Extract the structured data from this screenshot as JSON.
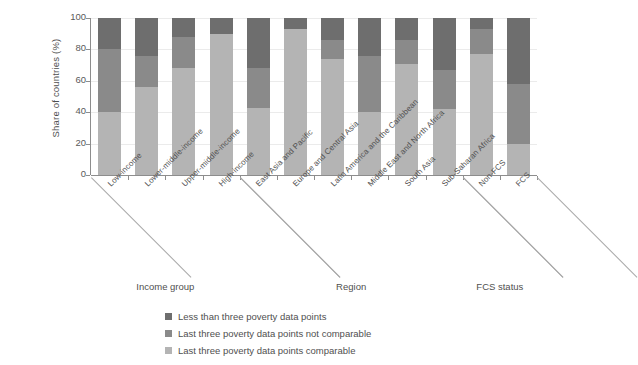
{
  "chart_data": {
    "type": "bar",
    "subtype": "stacked-bar-100",
    "title": "",
    "xlabel": "",
    "ylabel": "Share of countries (%)",
    "ylim": [
      0,
      100
    ],
    "yticks": [
      0,
      20,
      40,
      60,
      80,
      100
    ],
    "grid": true,
    "legend_position": "bottom",
    "stack_order_bottom_to_top": [
      "Last three poverty data points comparable",
      "Last three poverty data points not comparable",
      "Less than three poverty data points"
    ],
    "categories": [
      "Low-income",
      "Lower-middle-income",
      "Upper-middle-income",
      "High-income",
      "East Asia and Pacific",
      "Europe and Central Asia",
      "Latin America and the Caribbean",
      "Middle East and North Africa",
      "South Asia",
      "Sub-Saharan Africa",
      "Non-FCS",
      "FCS"
    ],
    "groups": [
      {
        "label": "Income group",
        "start": 0,
        "end": 3
      },
      {
        "label": "Region",
        "start": 4,
        "end": 9
      },
      {
        "label": "FCS status",
        "start": 10,
        "end": 11
      }
    ],
    "series": [
      {
        "name": "Last three poverty data points comparable",
        "color": "#b4b4b4",
        "values": [
          40,
          56,
          68,
          90,
          43,
          93,
          74,
          40,
          71,
          42,
          77,
          20
        ]
      },
      {
        "name": "Last three poverty data points not comparable",
        "color": "#8a8a8a",
        "values": [
          40,
          20,
          20,
          0,
          25,
          0,
          12,
          36,
          15,
          25,
          16,
          38
        ]
      },
      {
        "name": "Less than three poverty data points",
        "color": "#6e6e6e",
        "values": [
          20,
          24,
          12,
          10,
          32,
          7,
          14,
          24,
          14,
          33,
          7,
          42
        ]
      }
    ],
    "cumulative_tops": [
      [
        40,
        80,
        100
      ],
      [
        56,
        76,
        100
      ],
      [
        68,
        88,
        100
      ],
      [
        90,
        90,
        100
      ],
      [
        43,
        68,
        100
      ],
      [
        93,
        93,
        100
      ],
      [
        74,
        86,
        100
      ],
      [
        40,
        76,
        100
      ],
      [
        71,
        86,
        100
      ],
      [
        42,
        67,
        100
      ],
      [
        77,
        93,
        100
      ],
      [
        20,
        58,
        100
      ]
    ]
  },
  "legend": {
    "items": [
      {
        "label": "Less than three poverty data points",
        "color": "#6e6e6e"
      },
      {
        "label": "Last three poverty data points not comparable",
        "color": "#8a8a8a"
      },
      {
        "label": "Last three poverty data points comparable",
        "color": "#b4b4b4"
      }
    ]
  },
  "yticks": [
    {
      "label": "100"
    },
    {
      "label": "80"
    },
    {
      "label": "60"
    },
    {
      "label": "40"
    },
    {
      "label": "20"
    },
    {
      "label": "0"
    }
  ],
  "colors": {
    "series_dark": "#6e6e6e",
    "series_mid": "#8a8a8a",
    "series_light": "#b4b4b4",
    "axis": "#8d8d8d",
    "grid": "#ebebeb",
    "text": "#4f4f4f",
    "background": "#ffffff"
  }
}
